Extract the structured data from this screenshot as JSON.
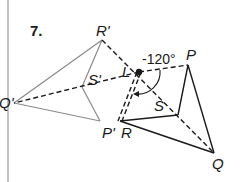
{
  "problem_number": "7.",
  "rotation_angle": "-120°",
  "center_label": "L",
  "original_labels": {
    "P": "P",
    "Q": "Q",
    "R": "R",
    "S": "S"
  },
  "image_labels": {
    "P": "P'",
    "Q": "Q'",
    "R": "R'",
    "S": "S'"
  },
  "colors": {
    "original_stroke": "#1a1a1a",
    "image_stroke": "#8a8a8a",
    "construction_stroke": "#1a1a1a",
    "margin_line": "#9a9a9a"
  }
}
